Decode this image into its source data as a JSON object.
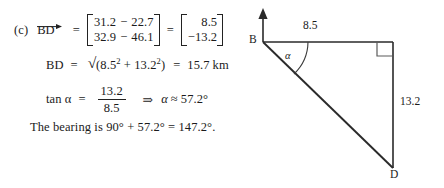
{
  "solution": {
    "part_label": "(c)",
    "vector_name": "BD",
    "equals": "=",
    "matrix_difference": {
      "row1": {
        "a": "31.2",
        "op": "−",
        "b": "22.7"
      },
      "row2": {
        "a": "32.9",
        "op": "−",
        "b": "46.1"
      }
    },
    "matrix_result": {
      "row1": "8.5",
      "row2": "−13.2"
    },
    "magnitude_line": {
      "lhs": "BD",
      "equals": "=",
      "radical_sign": "√",
      "radicand_open": "(8.5",
      "sup1": "2",
      "plus": " + 13.2",
      "sup2": "2",
      "radicand_close": ")",
      "equals2": "=",
      "value": "15.7",
      "unit": "km"
    },
    "tangent_line": {
      "lhs": "tan α",
      "equals": "=",
      "numerator": "13.2",
      "denominator": "8.5",
      "implies": "⇒",
      "angle_symbol": "α",
      "approx": "≈",
      "angle_value": "57.2°"
    },
    "bearing_sentence": "The bearing is 90° + 57.2° = 147.2°."
  },
  "diagram": {
    "type": "right-triangle-bearing",
    "vertices": {
      "b": "B",
      "d": "D"
    },
    "side_labels": {
      "top": "8.5",
      "right": "13.2"
    },
    "angle_label": "α",
    "north_arrow": "north-arrow",
    "right_angle_marker": "right-angle",
    "stroke_color": "#2a2a2a"
  }
}
